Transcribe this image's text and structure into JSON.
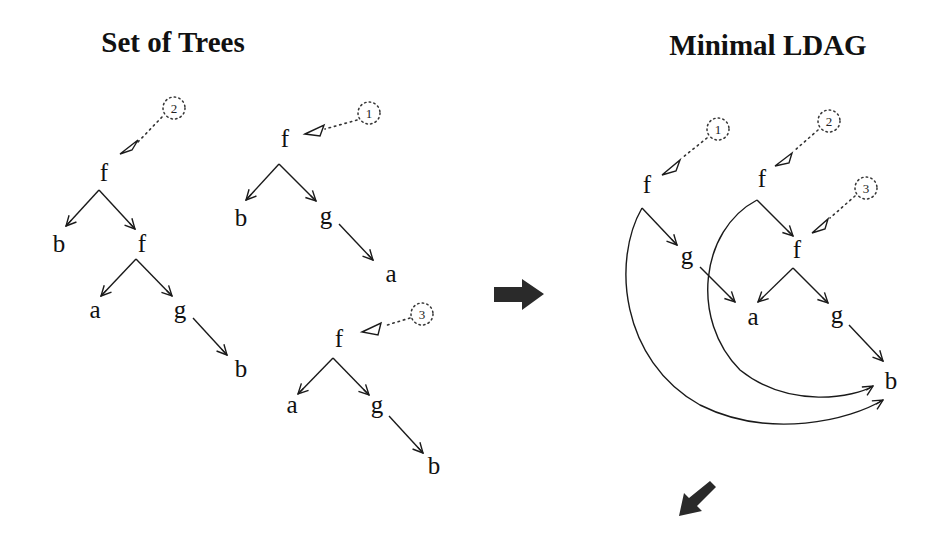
{
  "titles": {
    "left": "Set of Trees",
    "right": "Minimal LDAG"
  },
  "left_panel": {
    "trees": [
      {
        "root_label": "2",
        "nodes": [
          "f",
          "b",
          "f",
          "a",
          "g",
          "b"
        ],
        "structure": "f(b, f(a, g(b)))"
      },
      {
        "root_label": "1",
        "nodes": [
          "f",
          "b",
          "g",
          "a"
        ],
        "structure": "f(b, g(a))"
      },
      {
        "root_label": "3",
        "nodes": [
          "f",
          "a",
          "g",
          "b"
        ],
        "structure": "f(a, g(b))"
      }
    ]
  },
  "right_panel": {
    "roots": [
      {
        "label": "1",
        "points_to": "f (top-left)"
      },
      {
        "label": "2",
        "points_to": "f (top-middle)"
      },
      {
        "label": "3",
        "points_to": "f (inner)"
      }
    ],
    "nodes": [
      "f",
      "g",
      "f",
      "f",
      "a",
      "g",
      "b"
    ],
    "edges": [
      "f1 -> g",
      "f1 -> b (curved)",
      "g -> a",
      "f2 -> f3",
      "f2 -> b (curved)",
      "f3 -> a",
      "f3 -> g2",
      "g2 -> b"
    ]
  },
  "labels": {
    "t2_root": "2",
    "t2_f": "f",
    "t2_b": "b",
    "t2_f2": "f",
    "t2_a": "a",
    "t2_g": "g",
    "t2_b2": "b",
    "t1_root": "1",
    "t1_f": "f",
    "t1_b": "b",
    "t1_g": "g",
    "t1_a": "a",
    "t3_root": "3",
    "t3_f": "f",
    "t3_a": "a",
    "t3_g": "g",
    "t3_b": "b",
    "r_root1": "1",
    "r_root2": "2",
    "r_root3": "3",
    "r_f1": "f",
    "r_g1": "g",
    "r_f2": "f",
    "r_f3": "f",
    "r_a": "a",
    "r_g2": "g",
    "r_b": "b"
  },
  "arrows": {
    "transform": "right-arrow-icon",
    "next": "down-left-arrow-icon"
  }
}
